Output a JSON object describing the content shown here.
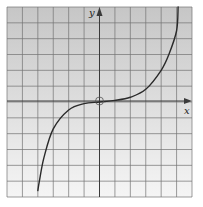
{
  "chart_data": {
    "type": "line",
    "title": "",
    "xlabel": "x",
    "ylabel": "y",
    "grid": true,
    "xlim": [
      -6,
      6
    ],
    "ylim": [
      -6,
      6
    ],
    "x_ticks_labeled": false,
    "y_ticks_labeled": false,
    "annotations": [
      "open circle at origin (0,0)"
    ],
    "series": [
      {
        "name": "curve",
        "x": [
          -4.0,
          -3.9,
          -3.6,
          -3.0,
          -2.0,
          -1.0,
          0.0,
          1.0,
          2.0,
          3.0,
          4.0,
          4.5,
          5.0,
          5.1
        ],
        "y": [
          -5.6,
          -5.0,
          -3.5,
          -1.7,
          -0.5,
          -0.1,
          0.0,
          0.1,
          0.3,
          0.8,
          2.0,
          3.0,
          4.5,
          6.0
        ]
      }
    ]
  },
  "axes": {
    "x_label": "x",
    "y_label": "y"
  },
  "colors": {
    "grid_background_top": "#c9c9c9",
    "grid_background_bottom": "#f4f4f4",
    "grid_lines": "#6e6e6e",
    "curve": "#2a2a2a",
    "axes": "#3a3a3a"
  }
}
